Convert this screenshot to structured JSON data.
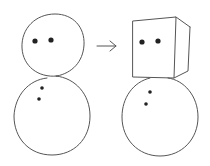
{
  "illustration": {
    "description": "Hand-drawn sketch: a two-ball snowman transforms into a snowman with a cube head",
    "colors": {
      "line": "#555555",
      "dots": "#222222",
      "background": "#ffffff"
    },
    "left_figure": {
      "name": "snowman-round-head",
      "head": {
        "cx": 53,
        "cy": 45,
        "r": 31
      },
      "eyes": [
        {
          "cx": 35,
          "cy": 41,
          "r": 2.6
        },
        {
          "cx": 51,
          "cy": 40,
          "r": 2.6
        }
      ],
      "body": {
        "cx": 52,
        "cy": 116,
        "r": 38
      },
      "buttons": [
        {
          "cx": 42,
          "cy": 88,
          "r": 1.8
        },
        {
          "cx": 39,
          "cy": 99,
          "r": 1.8
        }
      ]
    },
    "arrow": {
      "icon": "arrow-right-icon",
      "x1": 97,
      "y1": 46,
      "x2": 116,
      "y2": 46
    },
    "right_figure": {
      "name": "snowman-cube-head",
      "eyes": [
        {
          "cx": 142,
          "cy": 42,
          "r": 2.6
        },
        {
          "cx": 158,
          "cy": 41,
          "r": 2.6
        }
      ],
      "body": {
        "cx": 160,
        "cy": 117,
        "r": 38
      },
      "buttons": [
        {
          "cx": 150,
          "cy": 92,
          "r": 1.8
        },
        {
          "cx": 146,
          "cy": 104,
          "r": 1.8
        }
      ]
    }
  }
}
